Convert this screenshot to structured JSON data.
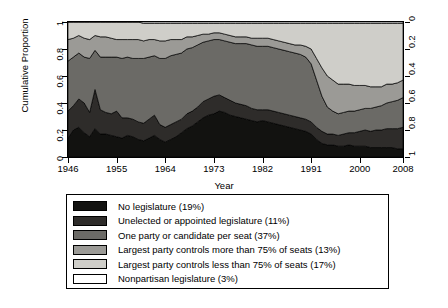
{
  "chart_data": {
    "type": "area",
    "title": "",
    "xlabel": "Year",
    "ylabel": "Cumulative Proportion",
    "xlim": [
      1946,
      2008
    ],
    "ylim": [
      0,
      1
    ],
    "grid": false,
    "stacked": true,
    "normalized": true,
    "legend_position": "below-plot",
    "x_ticks": [
      "1946",
      "1955",
      "1964",
      "1973",
      "1982",
      "1991",
      "2000",
      "2008"
    ],
    "x_tick_values": [
      1946,
      1955,
      1964,
      1973,
      1982,
      1991,
      2000,
      2008
    ],
    "y_ticks_left": [
      "0",
      "0.2",
      "0.4",
      "0.6",
      "0.8",
      "1"
    ],
    "y_tick_values_left": [
      0,
      0.2,
      0.4,
      0.6,
      0.8,
      1
    ],
    "y_ticks_right": [
      "0",
      "0.2",
      "0.4",
      "0.6",
      "0.8",
      "1"
    ],
    "y_tick_values_right": [
      0,
      0.2,
      0.4,
      0.6,
      0.8,
      1
    ],
    "right_axis_reversed": true,
    "x": [
      1946,
      1947,
      1948,
      1949,
      1950,
      1951,
      1952,
      1953,
      1954,
      1955,
      1956,
      1957,
      1958,
      1959,
      1960,
      1961,
      1962,
      1963,
      1964,
      1965,
      1966,
      1967,
      1968,
      1969,
      1970,
      1971,
      1972,
      1973,
      1974,
      1975,
      1976,
      1977,
      1978,
      1979,
      1980,
      1981,
      1982,
      1983,
      1984,
      1985,
      1986,
      1987,
      1988,
      1989,
      1990,
      1991,
      1992,
      1993,
      1994,
      1995,
      1996,
      1997,
      1998,
      1999,
      2000,
      2001,
      2002,
      2003,
      2004,
      2005,
      2006,
      2007,
      2008
    ],
    "series": [
      {
        "name": "No legislature (19%)",
        "label": "No legislature",
        "share": "19%",
        "color": "#121210",
        "values": [
          0.14,
          0.2,
          0.22,
          0.18,
          0.15,
          0.21,
          0.17,
          0.17,
          0.16,
          0.15,
          0.14,
          0.16,
          0.15,
          0.13,
          0.12,
          0.14,
          0.16,
          0.13,
          0.11,
          0.13,
          0.15,
          0.18,
          0.21,
          0.23,
          0.26,
          0.29,
          0.31,
          0.32,
          0.34,
          0.33,
          0.31,
          0.3,
          0.29,
          0.28,
          0.27,
          0.26,
          0.27,
          0.26,
          0.25,
          0.24,
          0.23,
          0.22,
          0.21,
          0.2,
          0.19,
          0.17,
          0.13,
          0.1,
          0.09,
          0.09,
          0.08,
          0.08,
          0.09,
          0.08,
          0.08,
          0.08,
          0.07,
          0.07,
          0.07,
          0.07,
          0.07,
          0.06,
          0.06
        ]
      },
      {
        "name": "Unelected or appointed legislature (11%)",
        "label": "Unelected or appointed legislature",
        "share": "11%",
        "color": "#2e2c2a",
        "values": [
          0.2,
          0.18,
          0.21,
          0.22,
          0.18,
          0.29,
          0.18,
          0.16,
          0.16,
          0.19,
          0.15,
          0.13,
          0.13,
          0.13,
          0.13,
          0.14,
          0.15,
          0.11,
          0.11,
          0.11,
          0.11,
          0.1,
          0.11,
          0.11,
          0.11,
          0.12,
          0.12,
          0.13,
          0.12,
          0.11,
          0.11,
          0.1,
          0.1,
          0.1,
          0.09,
          0.09,
          0.08,
          0.09,
          0.09,
          0.09,
          0.09,
          0.09,
          0.09,
          0.09,
          0.09,
          0.09,
          0.09,
          0.09,
          0.08,
          0.08,
          0.08,
          0.09,
          0.09,
          0.1,
          0.11,
          0.12,
          0.12,
          0.13,
          0.13,
          0.14,
          0.14,
          0.15,
          0.16
        ]
      },
      {
        "name": "One party or candidate per seat (37%)",
        "label": "One party or candidate per seat",
        "share": "37%",
        "color": "#6b6a66",
        "values": [
          0.37,
          0.36,
          0.34,
          0.34,
          0.4,
          0.29,
          0.39,
          0.41,
          0.42,
          0.4,
          0.44,
          0.45,
          0.45,
          0.47,
          0.48,
          0.46,
          0.44,
          0.49,
          0.51,
          0.51,
          0.5,
          0.49,
          0.48,
          0.47,
          0.46,
          0.44,
          0.43,
          0.42,
          0.41,
          0.42,
          0.43,
          0.44,
          0.45,
          0.46,
          0.47,
          0.47,
          0.47,
          0.47,
          0.47,
          0.47,
          0.47,
          0.47,
          0.47,
          0.47,
          0.46,
          0.43,
          0.35,
          0.26,
          0.2,
          0.17,
          0.16,
          0.16,
          0.16,
          0.16,
          0.16,
          0.16,
          0.17,
          0.17,
          0.18,
          0.19,
          0.2,
          0.21,
          0.22
        ]
      },
      {
        "name": "Largest party controls more than 75% of seats (13%)",
        "label": "Largest party controls more than 75% of seats",
        "share": "13%",
        "color": "#9b9a96",
        "values": [
          0.16,
          0.14,
          0.13,
          0.14,
          0.14,
          0.11,
          0.15,
          0.15,
          0.14,
          0.13,
          0.14,
          0.13,
          0.14,
          0.14,
          0.13,
          0.13,
          0.12,
          0.13,
          0.13,
          0.12,
          0.11,
          0.1,
          0.09,
          0.08,
          0.07,
          0.06,
          0.05,
          0.05,
          0.05,
          0.05,
          0.05,
          0.05,
          0.05,
          0.05,
          0.05,
          0.06,
          0.06,
          0.06,
          0.06,
          0.06,
          0.06,
          0.06,
          0.06,
          0.07,
          0.08,
          0.11,
          0.16,
          0.21,
          0.23,
          0.23,
          0.22,
          0.21,
          0.2,
          0.19,
          0.18,
          0.17,
          0.16,
          0.15,
          0.14,
          0.14,
          0.13,
          0.13,
          0.13
        ]
      },
      {
        "name": "Largest party controls less than 75% of seats (17%)",
        "label": "Largest party controls less than 75% of seats",
        "share": "17%",
        "color": "#cfcec9",
        "values": [
          0.13,
          0.12,
          0.1,
          0.12,
          0.13,
          0.1,
          0.11,
          0.11,
          0.12,
          0.13,
          0.13,
          0.13,
          0.13,
          0.13,
          0.13,
          0.12,
          0.12,
          0.13,
          0.13,
          0.12,
          0.12,
          0.12,
          0.1,
          0.1,
          0.09,
          0.08,
          0.08,
          0.07,
          0.07,
          0.08,
          0.09,
          0.1,
          0.1,
          0.1,
          0.11,
          0.11,
          0.11,
          0.11,
          0.12,
          0.13,
          0.14,
          0.15,
          0.16,
          0.16,
          0.17,
          0.19,
          0.26,
          0.33,
          0.39,
          0.42,
          0.45,
          0.45,
          0.45,
          0.46,
          0.46,
          0.46,
          0.47,
          0.47,
          0.47,
          0.45,
          0.45,
          0.44,
          0.42
        ]
      },
      {
        "name": "Nonpartisan legislature (3%)",
        "label": "Nonpartisan legislature",
        "share": "3%",
        "color": "#ffffff",
        "values": [
          0.0,
          0.0,
          0.0,
          0.0,
          0.0,
          0.0,
          0.0,
          0.0,
          0.0,
          0.0,
          0.0,
          0.0,
          0.0,
          0.0,
          0.01,
          0.01,
          0.01,
          0.01,
          0.01,
          0.01,
          0.01,
          0.01,
          0.01,
          0.01,
          0.01,
          0.01,
          0.01,
          0.01,
          0.01,
          0.01,
          0.01,
          0.01,
          0.01,
          0.01,
          0.01,
          0.01,
          0.01,
          0.01,
          0.01,
          0.01,
          0.01,
          0.01,
          0.01,
          0.01,
          0.01,
          0.01,
          0.01,
          0.01,
          0.01,
          0.01,
          0.01,
          0.01,
          0.01,
          0.01,
          0.01,
          0.01,
          0.01,
          0.01,
          0.01,
          0.01,
          0.01,
          0.01,
          0.01
        ]
      }
    ]
  }
}
